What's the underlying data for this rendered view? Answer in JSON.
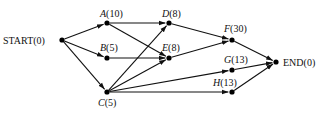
{
  "diagram": {
    "type": "project-network",
    "nodes": [
      {
        "id": "START",
        "name": "START",
        "duration": "0",
        "italic": false,
        "x": 62,
        "y": 40,
        "lx": 3,
        "ly": 44,
        "anchor": "start"
      },
      {
        "id": "A",
        "name": "A",
        "duration": "10",
        "italic": true,
        "x": 107,
        "y": 23,
        "lx": 100,
        "ly": 17,
        "anchor": "start"
      },
      {
        "id": "B",
        "name": "B",
        "duration": "5",
        "italic": true,
        "x": 107,
        "y": 58,
        "lx": 100,
        "ly": 51,
        "anchor": "start"
      },
      {
        "id": "C",
        "name": "C",
        "duration": "5",
        "italic": true,
        "x": 107,
        "y": 92,
        "lx": 98,
        "ly": 106,
        "anchor": "start"
      },
      {
        "id": "D",
        "name": "D",
        "duration": "8",
        "italic": true,
        "x": 169,
        "y": 23,
        "lx": 162,
        "ly": 17,
        "anchor": "start"
      },
      {
        "id": "E",
        "name": "E",
        "duration": "8",
        "italic": true,
        "x": 169,
        "y": 58,
        "lx": 162,
        "ly": 51,
        "anchor": "start"
      },
      {
        "id": "F",
        "name": "F",
        "duration": "30",
        "italic": true,
        "x": 232,
        "y": 40,
        "lx": 224,
        "ly": 32,
        "anchor": "start"
      },
      {
        "id": "G",
        "name": "G",
        "duration": "13",
        "italic": true,
        "x": 232,
        "y": 70,
        "lx": 224,
        "ly": 63,
        "anchor": "start"
      },
      {
        "id": "H",
        "name": "H",
        "duration": "13",
        "italic": true,
        "x": 232,
        "y": 92,
        "lx": 213,
        "ly": 86,
        "anchor": "start"
      },
      {
        "id": "END",
        "name": "END",
        "duration": "0",
        "italic": false,
        "x": 276,
        "y": 62,
        "lx": 283,
        "ly": 66,
        "anchor": "start"
      }
    ],
    "edges": [
      [
        "START",
        "A"
      ],
      [
        "START",
        "B"
      ],
      [
        "START",
        "C"
      ],
      [
        "A",
        "D"
      ],
      [
        "A",
        "E"
      ],
      [
        "B",
        "E"
      ],
      [
        "C",
        "D"
      ],
      [
        "C",
        "E"
      ],
      [
        "C",
        "G"
      ],
      [
        "C",
        "H"
      ],
      [
        "D",
        "F"
      ],
      [
        "E",
        "F"
      ],
      [
        "F",
        "END"
      ],
      [
        "G",
        "END"
      ],
      [
        "H",
        "END"
      ]
    ],
    "colors": {
      "line": "#111111",
      "node": "#000000",
      "background": "#ffffff"
    }
  }
}
